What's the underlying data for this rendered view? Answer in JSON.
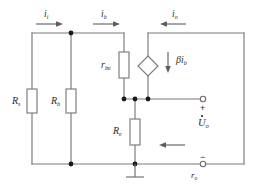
{
  "diagram": {
    "stroke_color": "#7a7a7a",
    "text_color": "#2b2b2b",
    "node_color": "#1a1a1a",
    "width": 258,
    "height": 194
  },
  "currents": [
    {
      "id": "i-input",
      "symbol": "i",
      "subscript": "i",
      "direction": "right"
    },
    {
      "id": "i-base",
      "symbol": "i",
      "subscript": "b",
      "direction": "right"
    },
    {
      "id": "i-output",
      "symbol": "i",
      "subscript": "o",
      "direction": "left"
    }
  ],
  "resistors": [
    {
      "id": "rs",
      "symbol": "R",
      "subscript": "s",
      "orientation": "vertical"
    },
    {
      "id": "rb",
      "symbol": "R",
      "subscript": "b",
      "orientation": "vertical"
    },
    {
      "id": "rbe",
      "symbol": "r",
      "subscript": "be",
      "orientation": "vertical"
    },
    {
      "id": "re",
      "symbol": "R",
      "subscript": "e",
      "orientation": "vertical"
    }
  ],
  "dependent_source": {
    "id": "beta-ib",
    "shape": "diamond",
    "type": "current-source",
    "symbol": "βi",
    "subscript": "b",
    "arrow_direction": "down"
  },
  "output": {
    "voltage_symbol": "U",
    "voltage_subscript": "o",
    "phasor_dot": true,
    "plus_sign": "+",
    "minus_sign": "−",
    "load_symbol": "r",
    "load_subscript": "o",
    "arrow_direction": "left"
  },
  "ground": {
    "id": "ground",
    "present": true
  }
}
